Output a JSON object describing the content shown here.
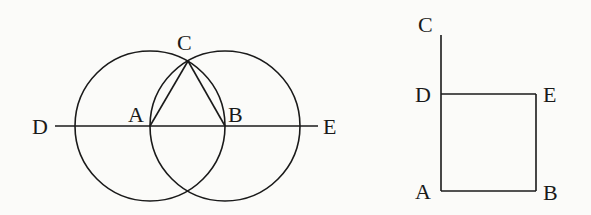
{
  "figures": [
    {
      "id": "equilateral-construction",
      "description": "Two intersecting circles centered at A and B with equilateral triangle ABC and line DE through A and B",
      "points": {
        "A": {
          "label": "A",
          "x": 150,
          "y": 126
        },
        "B": {
          "label": "B",
          "x": 225,
          "y": 126
        },
        "C": {
          "label": "C",
          "x": 188,
          "y": 61
        },
        "D": {
          "label": "D",
          "x": 55,
          "y": 126
        },
        "E": {
          "label": "E",
          "x": 318,
          "y": 126
        }
      },
      "circles": [
        {
          "center": "A",
          "radius": 75
        },
        {
          "center": "B",
          "radius": 75
        }
      ]
    },
    {
      "id": "square-construction",
      "description": "Square ABED with segment AC extending vertically above D",
      "points": {
        "A": {
          "label": "A",
          "x": 441,
          "y": 191
        },
        "B": {
          "label": "B",
          "x": 536,
          "y": 191
        },
        "C": {
          "label": "C",
          "x": 441,
          "y": 35
        },
        "D": {
          "label": "D",
          "x": 441,
          "y": 94
        },
        "E": {
          "label": "E",
          "x": 536,
          "y": 94
        }
      }
    }
  ],
  "stroke_color": "#1a1a1a"
}
